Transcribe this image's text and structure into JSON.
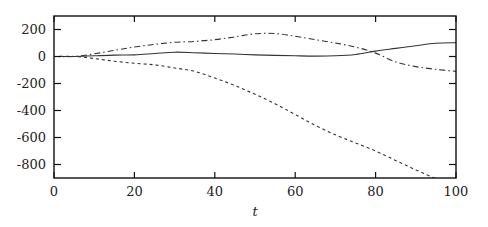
{
  "chart_data": {
    "type": "line",
    "title": "",
    "xlabel": "t",
    "ylabel": "",
    "xlim": [
      0,
      100
    ],
    "ylim": [
      -900,
      300
    ],
    "xticks": [
      0,
      20,
      40,
      60,
      80,
      100
    ],
    "yticks": [
      200,
      0,
      -200,
      -400,
      -600,
      -800
    ],
    "xtick_labels": [
      "0",
      "20",
      "40",
      "60",
      "80",
      "100"
    ],
    "ytick_labels": [
      "200",
      "0",
      "-200",
      "-400",
      "-600",
      "-800"
    ],
    "grid": false,
    "legend": null,
    "x": [
      0,
      5,
      10,
      15,
      20,
      25,
      30,
      35,
      40,
      45,
      50,
      55,
      60,
      65,
      70,
      75,
      80,
      85,
      90,
      95,
      100
    ],
    "series": [
      {
        "name": "solid",
        "style": "solid",
        "values": [
          0,
          0,
          5,
          10,
          12,
          22,
          32,
          28,
          22,
          18,
          12,
          8,
          5,
          3,
          5,
          15,
          40,
          60,
          80,
          98,
          102
        ]
      },
      {
        "name": "dashed",
        "style": "dashed",
        "values": [
          0,
          0,
          -15,
          -35,
          -50,
          -62,
          -85,
          -110,
          -160,
          -215,
          -280,
          -350,
          -430,
          -510,
          -580,
          -640,
          -700,
          -770,
          -840,
          -905,
          -960
        ]
      },
      {
        "name": "dash-dot",
        "style": "dashdot",
        "values": [
          0,
          0,
          20,
          45,
          70,
          90,
          105,
          112,
          125,
          145,
          168,
          170,
          150,
          125,
          100,
          70,
          25,
          -40,
          -75,
          -95,
          -110
        ]
      }
    ]
  }
}
